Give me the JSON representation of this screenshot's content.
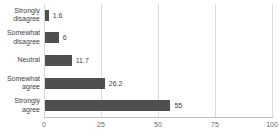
{
  "chart_data": {
    "type": "bar",
    "orientation": "horizontal",
    "categories": [
      "Strongly disagree",
      "Somewhat disagree",
      "Neutral",
      "Somewhat agree",
      "Strongly agree"
    ],
    "values": [
      1.6,
      6,
      11.7,
      26.2,
      55
    ],
    "value_labels": [
      "1.6",
      "6",
      "11.7",
      "26.2",
      "55"
    ],
    "xlim": [
      0,
      100
    ],
    "x_ticks": [
      "0",
      "25",
      "50",
      "75",
      "100"
    ],
    "grid": true,
    "legend": "none",
    "colors": {
      "bar": "#4f4f4f",
      "gridline": "#dcdcdc",
      "axis_line": "#bfbfbf",
      "category_text": "#3f3f3f",
      "value_text": "#3f3f3f",
      "tick_text": "#6a6a6a",
      "background": "#ffffff"
    }
  }
}
